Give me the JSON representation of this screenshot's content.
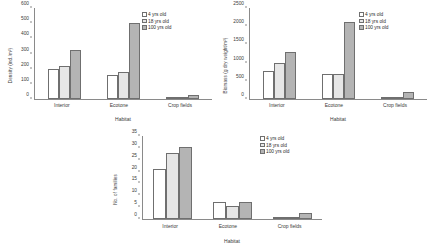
{
  "figure": {
    "background": "#ffffff",
    "series_colors": [
      "#ffffff",
      "#e6e6e6",
      "#b4b4b4"
    ],
    "border_color": "#6f6f6f"
  },
  "legend": {
    "items": [
      {
        "label": "4 yrs old"
      },
      {
        "label": "18 yrs old"
      },
      {
        "label": "100 yrs old"
      }
    ]
  },
  "chart_data": [
    {
      "type": "bar",
      "id": "density",
      "title": "",
      "xlabel": "Habitat",
      "ylabel": "Density (ind./m²)",
      "categories": [
        "Interior",
        "Ecotone",
        "Crop fields"
      ],
      "yticks": [
        0,
        100,
        200,
        300,
        400,
        500,
        600
      ],
      "ylim": [
        0,
        600
      ],
      "grid": false,
      "legend_position": "top-right",
      "series": [
        {
          "name": "4 yrs old",
          "values": [
            200,
            160,
            4
          ]
        },
        {
          "name": "18 yrs old",
          "values": [
            220,
            180,
            10
          ]
        },
        {
          "name": "100 yrs old",
          "values": [
            320,
            500,
            25
          ]
        }
      ]
    },
    {
      "type": "bar",
      "id": "biomass",
      "title": "",
      "xlabel": "Habitat",
      "ylabel": "Biomass (g dry weight/m²)",
      "categories": [
        "Interior",
        "Ecotone",
        "Crop fields"
      ],
      "yticks": [
        0,
        500,
        1000,
        1500,
        2000,
        2500
      ],
      "ylim": [
        0,
        2500
      ],
      "grid": false,
      "legend_position": "top-right",
      "series": [
        {
          "name": "4 yrs old",
          "values": [
            760,
            680,
            20
          ]
        },
        {
          "name": "18 yrs old",
          "values": [
            990,
            680,
            25
          ]
        },
        {
          "name": "100 yrs old",
          "values": [
            1290,
            2110,
            185
          ]
        }
      ]
    },
    {
      "type": "bar",
      "id": "families",
      "title": "",
      "xlabel": "Habitat",
      "ylabel": "No. of families",
      "categories": [
        "Interior",
        "Ecotone",
        "Crop fields"
      ],
      "yticks": [
        0,
        5,
        10,
        15,
        20,
        25,
        30,
        35
      ],
      "ylim": [
        0,
        35
      ],
      "grid": false,
      "legend_position": "top-right",
      "series": [
        {
          "name": "4 yrs old",
          "values": [
            21,
            7,
            1
          ]
        },
        {
          "name": "18 yrs old",
          "values": [
            28,
            5.3,
            1
          ]
        },
        {
          "name": "100 yrs old",
          "values": [
            30.5,
            7,
            2.5
          ]
        }
      ]
    }
  ]
}
